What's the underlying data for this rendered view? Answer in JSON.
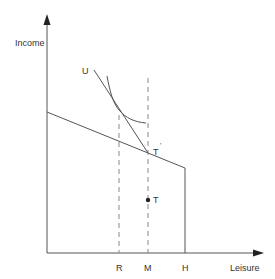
{
  "diagram": {
    "axes": {
      "y_label": "Income",
      "x_label": "Leisure"
    },
    "x_ticks": [
      "R",
      "M",
      "H"
    ],
    "points": {
      "T": "T",
      "T_prime": "T",
      "T_prime_mark": "'"
    },
    "curves": {
      "U": "U"
    },
    "colors": {
      "line": "#555555",
      "dashed": "#888888",
      "text": "#333333"
    }
  }
}
